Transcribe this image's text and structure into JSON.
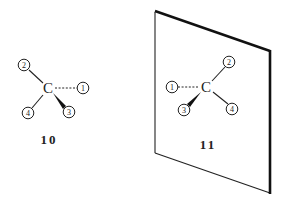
{
  "diagram": {
    "type": "stereochemistry-mirror-image",
    "colors": {
      "line": "#222222",
      "background": "#ffffff"
    },
    "molecule_10": {
      "label": "10",
      "center_atom": "C",
      "substituents": {
        "s1": "1",
        "s2": "2",
        "s3": "3",
        "s4": "4"
      },
      "bonds": {
        "s1": "dashed",
        "s2": "plain",
        "s3": "wedge",
        "s4": "plain"
      }
    },
    "molecule_11": {
      "label": "11",
      "center_atom": "C",
      "substituents": {
        "s1": "1",
        "s2": "2",
        "s3": "3",
        "s4": "4"
      },
      "bonds": {
        "s1": "dashed",
        "s2": "plain",
        "s3": "wedge",
        "s4": "plain"
      }
    },
    "mirror": {
      "name": "mirror-plane"
    }
  }
}
